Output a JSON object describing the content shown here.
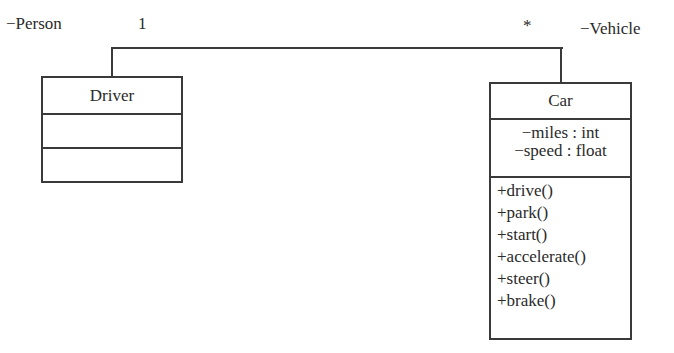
{
  "association": {
    "left_role": "−Person",
    "left_multiplicity": "1",
    "right_multiplicity": "*",
    "right_role": "−Vehicle"
  },
  "classes": {
    "driver": {
      "name": "Driver",
      "attributes": [],
      "operations": []
    },
    "car": {
      "name": "Car",
      "attributes": [
        "−miles : int",
        "−speed : float"
      ],
      "operations": [
        "+drive()",
        "+park()",
        "+start()",
        "+accelerate()",
        "+steer()",
        "+brake()"
      ]
    }
  },
  "colors": {
    "line": "#3a3a3a",
    "text": "#2a2a2a",
    "background": "#ffffff"
  }
}
